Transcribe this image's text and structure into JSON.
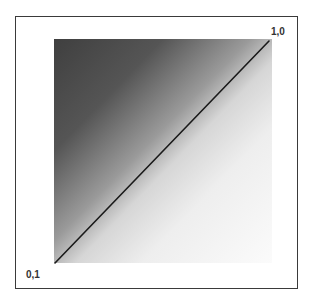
{
  "diagram": {
    "labels": {
      "top_right": "1,0",
      "bottom_left": "0,1"
    },
    "gradient": {
      "dark_corner": "bottom-left",
      "light_corner": "top-right",
      "dark_color": "#3f3f3f",
      "light_color": "#f5f5f5"
    },
    "diagonal_line": {
      "from": "0,1",
      "to": "1,0",
      "color": "#1a1a1a"
    }
  }
}
